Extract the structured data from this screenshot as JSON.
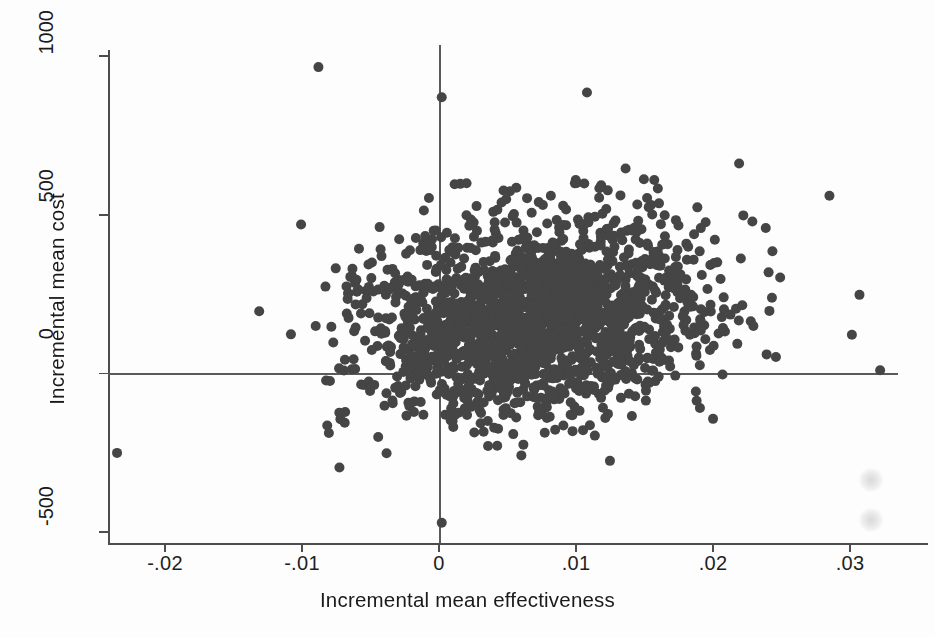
{
  "chart_data": {
    "type": "scatter",
    "title": "",
    "xlabel": "Incremental mean effectiveness",
    "ylabel": "Incremental mean cost",
    "xticks": [
      "-.02",
      "-.01",
      "0",
      ".01",
      ".02",
      ".03"
    ],
    "xtick_values": [
      -0.02,
      -0.01,
      0,
      0.01,
      0.02,
      0.03
    ],
    "yticks": [
      "-500",
      "0",
      "500",
      "1000"
    ],
    "ytick_values": [
      -500,
      0,
      500,
      1000
    ],
    "xlim": [
      -0.0255,
      0.0335
    ],
    "ylim": [
      -560,
      1060
    ],
    "grid": false,
    "legend": null,
    "marker": {
      "shape": "circle",
      "color": "#454545",
      "size_px": 10,
      "count": 2000
    },
    "reference_lines": [
      {
        "axis": "x",
        "value": 0
      },
      {
        "axis": "y",
        "value": 0
      }
    ],
    "cloud": {
      "description": "bootstrap replicates of incremental cost-effectiveness, dense elliptical cloud",
      "center_x": 0.0068,
      "center_y": 175,
      "sd_x": 0.0062,
      "sd_y": 150,
      "n_points": 2000
    },
    "outliers": [
      {
        "x": -0.0235,
        "y": -250
      },
      {
        "x": -0.0088,
        "y": 965
      },
      {
        "x": 0.0002,
        "y": -470
      },
      {
        "x": 0.0002,
        "y": 870
      },
      {
        "x": 0.0322,
        "y": 10
      },
      {
        "x": 0.0285,
        "y": 560
      },
      {
        "x": 0.0108,
        "y": 885
      }
    ]
  },
  "figure": {
    "background_color": "#fdfdfd",
    "marker_color": "#454545",
    "axis_color": "#4d4d4d"
  }
}
